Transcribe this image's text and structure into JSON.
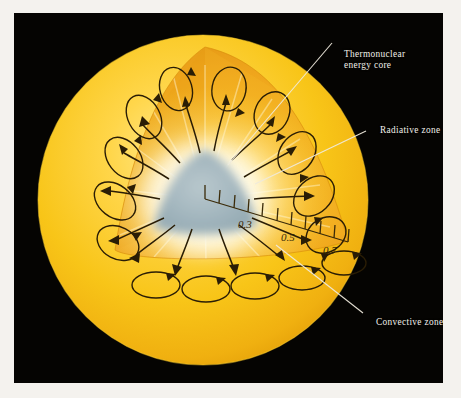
{
  "figure": {
    "background_color": "#050402",
    "border_color": "#f4f2ee",
    "sun_color": "#f5c518",
    "sun_highlight_color": "#ffe27a",
    "wedge_color": "#f0a81e",
    "core_color": "#9db3bb",
    "cell_outline_color": "#2a1d05",
    "label_color": "#f2f0ea",
    "leader_color": "#efeadd"
  },
  "labels": {
    "core": {
      "line1": "Thermonuclear",
      "line2": "energy core"
    },
    "radiative": {
      "line1": "Radiative zone"
    },
    "convective": {
      "line1": "Convective zone"
    }
  },
  "scale": {
    "name": "fractional-solar-radius-ruler",
    "ticks": [
      0.1,
      0.2,
      0.3,
      0.4,
      0.5,
      0.6,
      0.7,
      0.8,
      0.9,
      1.0
    ],
    "tick_labels": [
      "0.3",
      "0.5",
      "0.7"
    ],
    "labeled_values": [
      0.3,
      0.5,
      0.7
    ],
    "unit": "fraction of solar radius"
  },
  "zones": [
    {
      "name": "thermonuclear-energy-core",
      "label": "Thermonuclear energy core",
      "color": "#9db3bb"
    },
    {
      "name": "radiative-zone",
      "label": "Radiative zone",
      "color": "#f5c21a"
    },
    {
      "name": "convective-zone",
      "label": "Convective zone",
      "color": "#f0a81e"
    }
  ],
  "counts": {
    "convection_cells": 17,
    "radiative_arrows": 16
  }
}
